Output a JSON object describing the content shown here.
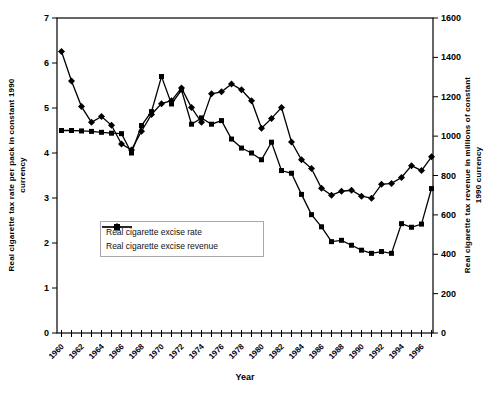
{
  "figure": {
    "xlabel": "Year",
    "ylabel_left_line1": "Real cigarette tax rate per pack in constant 1990",
    "ylabel_left_line2": "currency",
    "ylabel_right_line1": "Real cigarette tax revenue in millions of constant",
    "ylabel_right_line2": "1990 currency",
    "legend_rate": "Real cigarette excise rate",
    "legend_revenue": "Real cigarette excise revenue",
    "line_color": "#000000",
    "background_color": "#ffffff"
  },
  "chart_data": {
    "type": "line",
    "x": [
      1960,
      1961,
      1962,
      1963,
      1964,
      1965,
      1966,
      1967,
      1968,
      1969,
      1970,
      1971,
      1972,
      1973,
      1974,
      1975,
      1976,
      1977,
      1978,
      1979,
      1980,
      1981,
      1982,
      1983,
      1984,
      1985,
      1986,
      1987,
      1988,
      1989,
      1990,
      1991,
      1992,
      1993,
      1994,
      1995,
      1996,
      1997
    ],
    "series": [
      {
        "name": "Real cigarette excise rate",
        "axis": "left",
        "marker": "square",
        "values": [
          4.5,
          4.5,
          4.49,
          4.48,
          4.46,
          4.44,
          4.43,
          4.0,
          4.61,
          4.92,
          5.7,
          5.09,
          5.4,
          4.64,
          4.78,
          4.64,
          4.72,
          4.31,
          4.11,
          4.0,
          3.85,
          4.24,
          3.61,
          3.55,
          3.08,
          2.63,
          2.36,
          2.03,
          2.06,
          1.95,
          1.84,
          1.77,
          1.81,
          1.77,
          2.43,
          2.35,
          2.42,
          3.21
        ]
      },
      {
        "name": "Real cigarette excise revenue",
        "axis": "right",
        "marker": "diamond",
        "values": [
          1430,
          1280,
          1150,
          1070,
          1100,
          1055,
          960,
          930,
          1025,
          1110,
          1165,
          1180,
          1245,
          1145,
          1070,
          1215,
          1225,
          1265,
          1235,
          1180,
          1040,
          1090,
          1145,
          970,
          880,
          835,
          735,
          700,
          720,
          725,
          695,
          685,
          755,
          760,
          790,
          850,
          825,
          895
        ]
      }
    ],
    "left_axis": {
      "label": "Real cigarette tax rate per pack in constant 1990 currency",
      "min": 0,
      "max": 7,
      "step": 1
    },
    "right_axis": {
      "label": "Real cigarette tax revenue in millions of constant 1990 currency",
      "min": 0,
      "max": 1600,
      "step": 200
    },
    "x_axis": {
      "label": "Year",
      "min": 1960,
      "max": 1997,
      "tick_every_year": true,
      "label_step": 2,
      "label_rotation_deg": -45
    },
    "grid": false,
    "legend_position": "center-left-inside",
    "title": ""
  }
}
